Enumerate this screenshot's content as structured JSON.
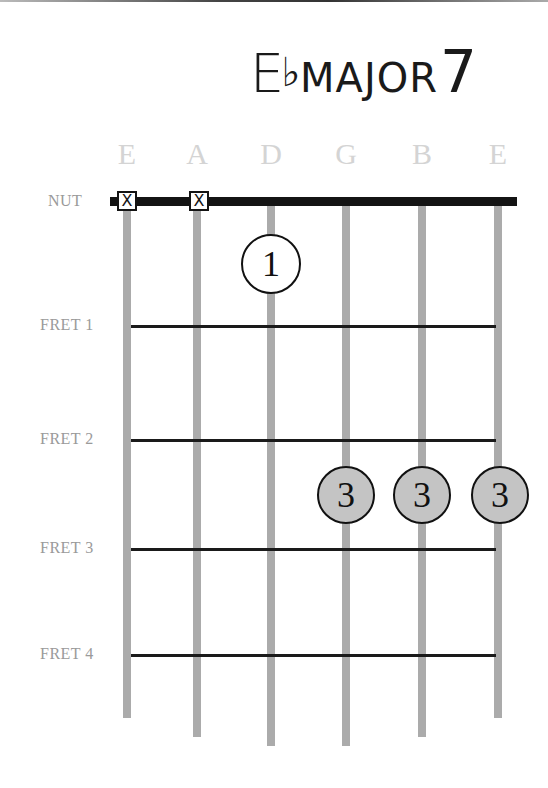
{
  "chord": {
    "root": "E",
    "accidental": "♭",
    "quality": "MAJOR",
    "extension": "7",
    "full_name": "E♭MAJOR7"
  },
  "strings": [
    {
      "name": "E",
      "x": 127,
      "end_y": 718,
      "state": "muted"
    },
    {
      "name": "A",
      "x": 197,
      "end_y": 737,
      "state": "muted"
    },
    {
      "name": "D",
      "x": 271,
      "end_y": 746,
      "state": "fretted"
    },
    {
      "name": "G",
      "x": 346,
      "end_y": 746,
      "state": "fretted"
    },
    {
      "name": "B",
      "x": 422,
      "end_y": 737,
      "state": "fretted"
    },
    {
      "name": "E",
      "x": 498,
      "end_y": 718,
      "state": "fretted"
    }
  ],
  "rows": [
    {
      "label": "NUT",
      "y": 202
    },
    {
      "label": "FRET 1",
      "y": 326
    },
    {
      "label": "FRET 2",
      "y": 440
    },
    {
      "label": "FRET 3",
      "y": 549
    },
    {
      "label": "FRET 4",
      "y": 655
    }
  ],
  "mute_marker": "X",
  "fingers": [
    {
      "string": "D",
      "position": "between nut and fret 1",
      "finger": "1",
      "x": 271,
      "y": 264,
      "style": "white"
    },
    {
      "string": "G",
      "position": "between fret 2 and fret 3",
      "finger": "3",
      "x": 346,
      "y": 495,
      "style": "gray"
    },
    {
      "string": "B",
      "position": "between fret 2 and fret 3",
      "finger": "3",
      "x": 422,
      "y": 495,
      "style": "gray"
    },
    {
      "string": "E",
      "position": "between fret 2 and fret 3",
      "finger": "3",
      "x": 498,
      "y": 495,
      "style": "gray"
    }
  ],
  "colors": {
    "string": "#ababab",
    "nut": "#141414",
    "fret": "#1a1a1a",
    "string_label": "#d4d4d4",
    "row_label": "#9a9a9a",
    "barre_fill": "#c4c4c4"
  }
}
